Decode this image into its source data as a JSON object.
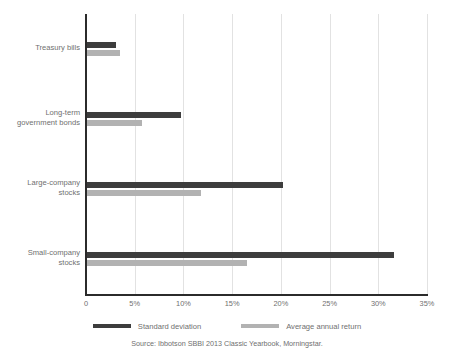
{
  "chart_data": {
    "type": "bar",
    "orientation": "horizontal",
    "title": "",
    "xlabel": "",
    "ylabel": "",
    "categories": [
      "Treasury bills",
      "Long-term government bonds",
      "Large-company stocks",
      "Small-company stocks"
    ],
    "series": [
      {
        "name": "Standard deviation",
        "color": "#3d3d3d",
        "values": [
          3.1,
          9.7,
          20.2,
          31.6
        ]
      },
      {
        "name": "Average annual return",
        "color": "#b2b2b2",
        "values": [
          3.5,
          5.7,
          11.8,
          16.5
        ]
      }
    ],
    "xlim": [
      0,
      35
    ],
    "xticks": [
      0,
      5,
      10,
      15,
      20,
      25,
      30,
      35
    ],
    "xtick_labels": [
      "0",
      "5%",
      "10%",
      "15%",
      "20%",
      "25%",
      "30%",
      "35%"
    ],
    "grid": "vertical",
    "legend_position": "bottom",
    "value_suffix": "%"
  },
  "category_lines": [
    [
      "Treasury bills"
    ],
    [
      "Long-term",
      "government bonds"
    ],
    [
      "Large-company",
      "stocks"
    ],
    [
      "Small-company",
      "stocks"
    ]
  ],
  "footer": {
    "source": "Source: Ibbotson SBBI 2013 Classic Yearbook, Morningstar."
  }
}
